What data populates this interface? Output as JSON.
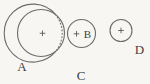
{
  "figure": {
    "colors": {
      "background": "#f7f6f2",
      "line": "#6b6b6b",
      "label": "#3e3e3e",
      "center_mark": "#5a5a5a"
    },
    "circles": [
      {
        "id": "A",
        "cx": 41,
        "cy": 33,
        "r": 23.5,
        "style": "solid"
      },
      {
        "id": "C",
        "cx": 78,
        "cy": 32.5,
        "r": 29,
        "style": "split",
        "dotted_arc": {
          "x1": 55.35,
          "y1": 14.39,
          "x2": 55.85,
          "y2": 51.21,
          "large_arc_dotted": 0,
          "sweep_dotted": 1
        }
      },
      {
        "id": "B",
        "cx": 81.5,
        "cy": 33.5,
        "r": 14,
        "style": "solid"
      },
      {
        "id": "D",
        "cx": 121,
        "cy": 30.5,
        "r": 11,
        "style": "solid"
      }
    ],
    "center_marks": [
      {
        "of": "A",
        "x": 42.5,
        "y": 33.3,
        "arm": 2.8
      },
      {
        "of": "C",
        "x": 76.5,
        "y": 33.8,
        "arm": 2.8
      },
      {
        "of": "D",
        "x": 121,
        "y": 30.5,
        "arm": 2.8
      }
    ],
    "labels": [
      {
        "text": "A",
        "x": 22,
        "y": 71,
        "size": 13
      },
      {
        "text": "B",
        "x": 87.5,
        "y": 38,
        "size": 11
      },
      {
        "text": "C",
        "x": 81,
        "y": 79.5,
        "size": 13
      },
      {
        "text": "D",
        "x": 139.5,
        "y": 53.5,
        "size": 13
      }
    ],
    "stroke_width": 1.1,
    "dot_dash": "1 2.4"
  }
}
